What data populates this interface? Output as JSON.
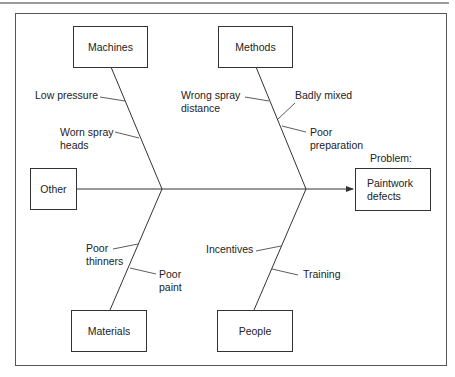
{
  "diagram": {
    "type": "fishbone (cause and effect)",
    "problem_heading": "Problem:",
    "problem": "Paintwork\ndefects",
    "categories": {
      "machines": {
        "label": "Machines",
        "causes": [
          "Low pressure",
          "Worn spray\nheads"
        ]
      },
      "methods": {
        "label": "Methods",
        "causes": [
          "Wrong spray\ndistance",
          "Badly mixed",
          "Poor\npreparation"
        ]
      },
      "other": {
        "label": "Other",
        "causes": []
      },
      "materials": {
        "label": "Materials",
        "causes": [
          "Poor\nthinners",
          "Poor\npaint"
        ]
      },
      "people": {
        "label": "People",
        "causes": [
          "Incentives",
          "Training"
        ]
      }
    },
    "colors": {
      "line": "#333333",
      "frame": "#555555",
      "top_rule": "#9a9a9a",
      "background": "#ffffff"
    }
  }
}
